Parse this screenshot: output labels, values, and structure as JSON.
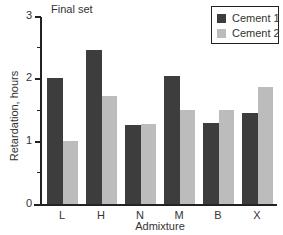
{
  "chart_data": {
    "type": "bar",
    "title": "Final set",
    "xlabel": "Admixture",
    "ylabel": "Retardation, hours",
    "categories": [
      "L",
      "H",
      "N",
      "M",
      "B",
      "X"
    ],
    "series": [
      {
        "name": "Cement 1",
        "color": "#3d3d3d",
        "values": [
          2.0,
          2.45,
          1.25,
          2.03,
          1.28,
          1.45
        ]
      },
      {
        "name": "Cement 2",
        "color": "#bcbcbc",
        "values": [
          1.0,
          1.72,
          1.27,
          1.5,
          1.5,
          1.85
        ]
      }
    ],
    "ylim": [
      0,
      3
    ],
    "yticks": [
      "0",
      "1",
      "2",
      "3"
    ],
    "grid": false,
    "legend_position": "upper right"
  }
}
